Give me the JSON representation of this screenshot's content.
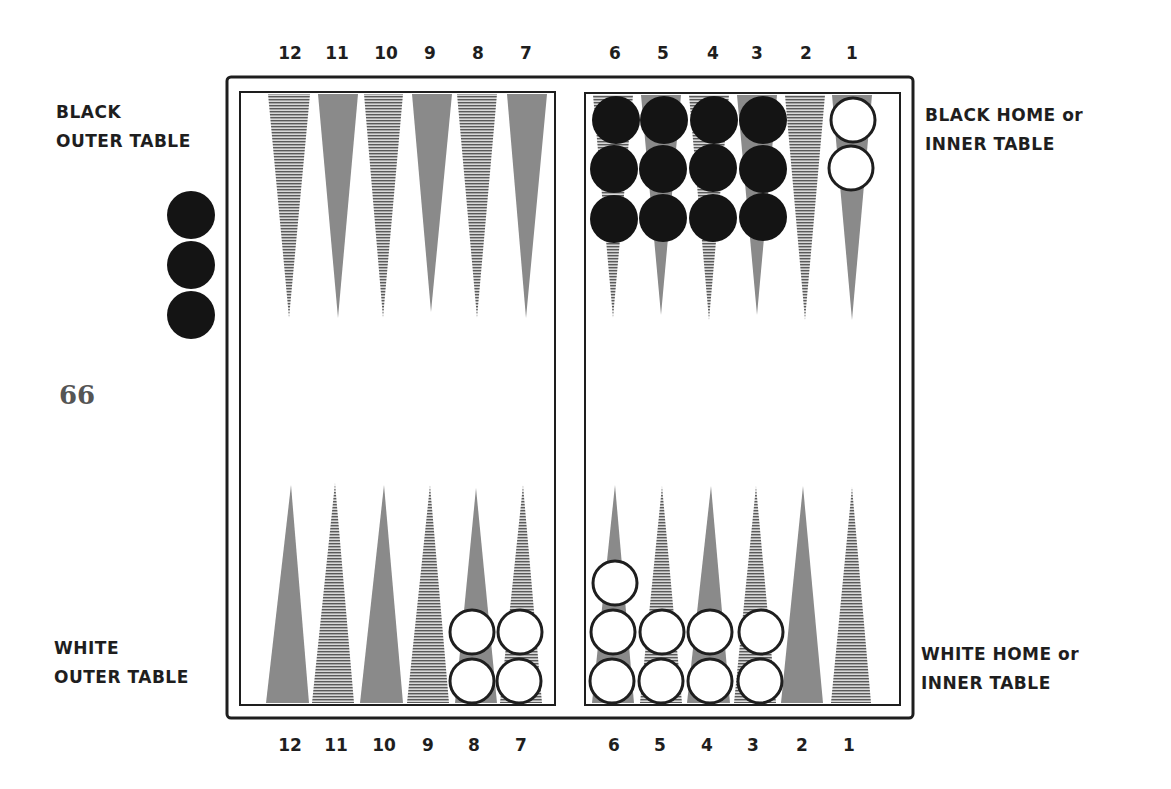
{
  "page_number": "66",
  "labels": {
    "black_outer": [
      "BLACK",
      "OUTER TABLE"
    ],
    "black_home": [
      "BLACK HOME or",
      "INNER TABLE"
    ],
    "white_outer": [
      "WHITE",
      "OUTER TABLE"
    ],
    "white_home": [
      "WHITE HOME or",
      "INNER TABLE"
    ]
  },
  "point_numbers_top": [
    "12",
    "11",
    "10",
    "9",
    "8",
    "7",
    "6",
    "5",
    "4",
    "3",
    "2",
    "1"
  ],
  "point_numbers_bottom": [
    "12",
    "11",
    "10",
    "9",
    "8",
    "7",
    "6",
    "5",
    "4",
    "3",
    "2",
    "1"
  ],
  "colors": {
    "frame": "#1e1e1e",
    "gray_point": "#8a8a8a",
    "striped_point_line": "#5a5a5a",
    "black_checker": "#141414",
    "white_checker_fill": "#ffffff",
    "white_checker_stroke": "#1e1e1e"
  },
  "position": {
    "black": {
      "points": {
        "6": 3,
        "5": 3,
        "4": 3,
        "3": 3
      },
      "bar_or_off": 3
    },
    "white": {
      "points": {
        "1": 2,
        "6": 3,
        "5": 2,
        "4": 2,
        "3": 2,
        "8": 2,
        "7": 2
      }
    }
  }
}
